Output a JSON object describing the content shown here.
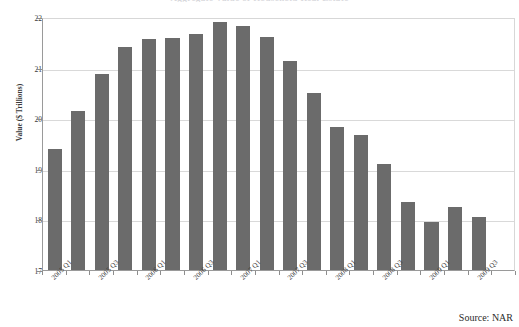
{
  "chart_data": {
    "type": "bar",
    "title": "Aggregate Value of Household Real Estate",
    "xlabel": "",
    "ylabel": "Value ($ Trillions)",
    "ylim": [
      17,
      22
    ],
    "yticks": [
      17,
      18,
      19,
      20,
      21,
      22
    ],
    "grid": true,
    "legend": "none",
    "bar_color": "#6b6b6b",
    "categories": [
      "2005 Q1",
      "2005 Q2",
      "2005 Q3",
      "2005 Q4",
      "2006 Q1",
      "2006 Q2",
      "2006 Q3",
      "2006 Q4",
      "2007 Q1",
      "2007 Q2",
      "2007 Q3",
      "2007 Q4",
      "2008 Q1",
      "2008 Q2",
      "2008 Q3",
      "2008 Q4",
      "2009 Q1",
      "2009 Q2",
      "2009 Q3",
      "2009 Q4"
    ],
    "tick_labels": [
      "2005 Q1",
      "2005 Q3",
      "2006 Q1",
      "2006 Q3",
      "2007 Q1",
      "2007 Q3",
      "2008 Q1",
      "2008 Q3",
      "2009 Q1",
      "2009 Q3"
    ],
    "values": [
      19.4,
      20.15,
      20.88,
      21.4,
      21.57,
      21.58,
      21.67,
      21.9,
      21.83,
      21.6,
      21.13,
      20.5,
      19.82,
      19.67,
      19.1,
      18.35,
      17.95,
      18.25,
      18.05,
      17.0
    ]
  },
  "source": {
    "note": "Source: NAR"
  }
}
